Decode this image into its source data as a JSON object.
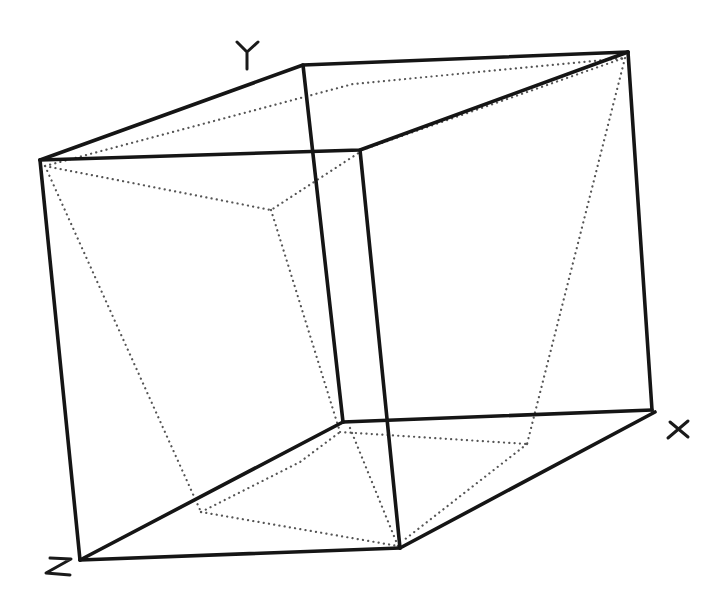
{
  "diagram": {
    "axes": {
      "x_label": "X",
      "y_label": "Y",
      "z_label": "Z"
    },
    "colors": {
      "background": "#ffffff",
      "solid_edge": "#151515",
      "dotted_edge": "#555555"
    },
    "vertices": {
      "top_left_front": [
        40,
        160
      ],
      "top_back": [
        303,
        65
      ],
      "top_right": [
        628,
        52
      ],
      "top_front": [
        360,
        150
      ],
      "bottom_left_z": [
        80,
        560
      ],
      "bottom_back": [
        343,
        422
      ],
      "bottom_right_x": [
        652,
        410
      ],
      "bottom_front": [
        400,
        548
      ]
    },
    "inner_vertices": {
      "p_top_left": [
        45,
        166
      ],
      "p_top_back": [
        353,
        84
      ],
      "p_top_mid": [
        271,
        210
      ],
      "p_top_front": [
        360,
        152
      ],
      "p_top_right": [
        625,
        58
      ],
      "q_bottom_back": [
        340,
        432
      ],
      "q_bottom_right": [
        527,
        444
      ],
      "q_bottom_front": [
        398,
        546
      ],
      "q_bottom_left": [
        201,
        512
      ]
    }
  }
}
